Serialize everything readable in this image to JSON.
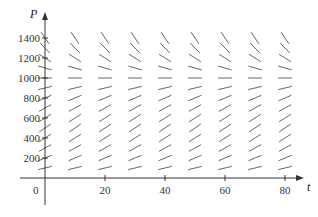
{
  "chart_data": {
    "type": "slope_field",
    "title": "",
    "xlabel": "t",
    "ylabel": "P",
    "xlim": [
      0,
      90
    ],
    "ylim": [
      0,
      1500
    ],
    "x_ticks": [
      20,
      40,
      60,
      80
    ],
    "x_tick_labels": [
      "20",
      "40",
      "60",
      "80"
    ],
    "y_ticks": [
      200,
      400,
      600,
      800,
      1000,
      1200,
      1400
    ],
    "y_tick_labels": [
      "200",
      "400",
      "600",
      "800",
      "1000",
      "1200",
      "1400"
    ],
    "origin_label": "0",
    "grid": false,
    "legend": null,
    "field_columns_t": [
      0,
      10,
      20,
      30,
      40,
      50,
      60,
      70,
      80
    ],
    "field_rows_P": [
      100,
      200,
      300,
      400,
      500,
      600,
      700,
      800,
      900,
      1000,
      1100,
      1200,
      1300,
      1400
    ],
    "equilibrium_P": 1000
  },
  "colors": {
    "axis": "#333333",
    "segment": "#555555"
  }
}
